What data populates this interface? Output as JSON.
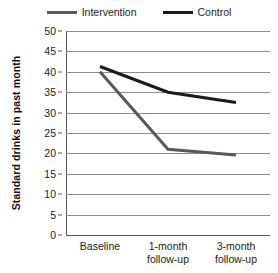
{
  "chart_data": {
    "type": "line",
    "title": "",
    "xlabel": "",
    "ylabel": "Standard drinks in past month",
    "categories": [
      "Baseline",
      "1-month follow-up",
      "3-month follow-up"
    ],
    "category_lines": [
      [
        "Baseline"
      ],
      [
        "1-month",
        "follow-up"
      ],
      [
        "3-month",
        "follow-up"
      ]
    ],
    "series": [
      {
        "name": "Intervention",
        "color": "#595959",
        "values": [
          40.0,
          21.0,
          19.6
        ]
      },
      {
        "name": "Control",
        "color": "#1a1a1a",
        "values": [
          41.3,
          35.0,
          32.5
        ]
      }
    ],
    "ylim": [
      0,
      50
    ],
    "ytick_step": 5,
    "yticks": [
      50,
      45,
      40,
      35,
      30,
      25,
      20,
      15,
      10,
      5,
      0
    ],
    "ytick_labels": [
      "50",
      "45",
      "40",
      "35",
      "30",
      "25",
      "20",
      "15",
      "10",
      "5",
      "0"
    ],
    "grid": true,
    "grid_axis": "y",
    "grid_color": "#8c8c8c",
    "legend_position": "top-center",
    "background": "#ffffff",
    "axis_color": "#5a5a5a"
  },
  "legend": {
    "entries": [
      {
        "label": "Intervention",
        "color": "#595959"
      },
      {
        "label": "Control",
        "color": "#1a1a1a"
      }
    ]
  }
}
